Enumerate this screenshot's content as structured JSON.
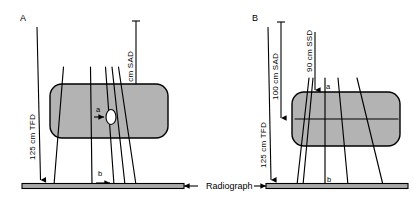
{
  "figure": {
    "background_color": "#ffffff",
    "line_color": "#000000",
    "phantom_fill": "#b3b3b3",
    "film_fill": "#a8a8a8",
    "lesion_fill": "#ffffff"
  },
  "center": {
    "radiograph_label": "Radiograph",
    "left_arrow_icon": "arrow-left-icon",
    "right_arrow_icon": "arrow-right-icon"
  },
  "panels": [
    {
      "id": "A",
      "label": "A",
      "dimensions": [
        {
          "key": "tfd",
          "text": "125 cm TFD",
          "orientation": "vertical",
          "arrow": "down"
        },
        {
          "key": "sad",
          "text": "100 cm SAD",
          "orientation": "vertical",
          "arrow": "down"
        }
      ],
      "point_labels": [
        {
          "key": "a",
          "text": "a",
          "arrow": "right"
        },
        {
          "key": "b",
          "text": "b",
          "arrow": "right"
        }
      ],
      "beam_count": 5,
      "has_lesion": true,
      "has_internal_line": false
    },
    {
      "id": "B",
      "label": "B",
      "dimensions": [
        {
          "key": "tfd",
          "text": "125 cm TFD",
          "orientation": "vertical",
          "arrow": "down"
        },
        {
          "key": "sad",
          "text": "100 cm SAD",
          "orientation": "vertical",
          "arrow": "down"
        },
        {
          "key": "ssd",
          "text": "90 cm SSD",
          "orientation": "vertical",
          "arrow": "down"
        }
      ],
      "point_labels": [
        {
          "key": "a",
          "text": "a",
          "arrow": "none"
        },
        {
          "key": "b",
          "text": "b",
          "arrow": "none"
        }
      ],
      "beam_count": 5,
      "has_lesion": false,
      "has_internal_line": true
    }
  ]
}
